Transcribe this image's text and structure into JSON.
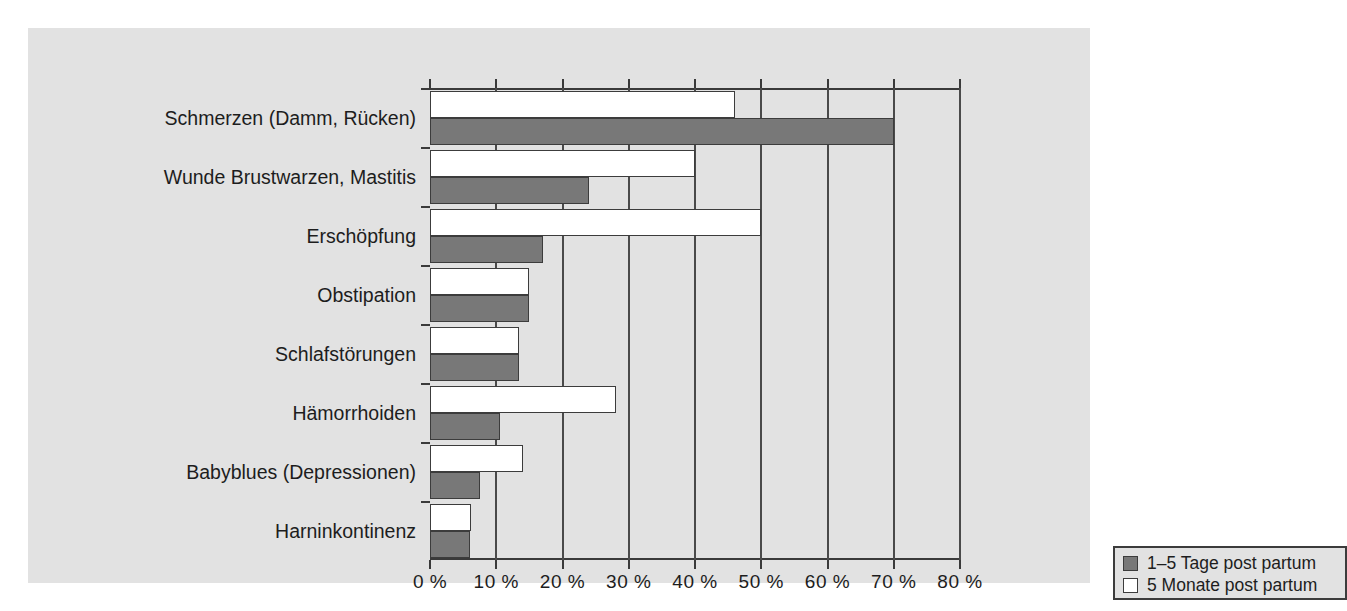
{
  "chart_data": {
    "type": "bar",
    "orientation": "horizontal",
    "title": "",
    "xlabel": "",
    "ylabel": "",
    "xlim": [
      0,
      80
    ],
    "xtick_labels": [
      "0 %",
      "10 %",
      "20 %",
      "30 %",
      "40 %",
      "50 %",
      "60 %",
      "70 %",
      "80 %"
    ],
    "xticks": [
      0,
      10,
      20,
      30,
      40,
      50,
      60,
      70,
      80
    ],
    "grid": true,
    "grid_axis": "x",
    "legend_position": "inside-bottom-right",
    "categories": [
      "Schmerzen (Damm, Rücken)",
      "Wunde Brustwarzen, Mastitis",
      "Erschöpfung",
      "Obstipation",
      "Schlafstörungen",
      "Hämorrhoiden",
      "Babyblues (Depressionen)",
      "Harninkontinenz"
    ],
    "series": [
      {
        "name": "1–5 Tage post partum",
        "color": "#787878",
        "values": [
          70,
          24,
          17,
          15,
          13.5,
          10.5,
          7.5,
          6
        ]
      },
      {
        "name": "5 Monate post partum",
        "color": "#ffffff",
        "values": [
          46,
          40,
          50,
          15,
          13.5,
          28,
          14,
          6.2
        ]
      }
    ]
  },
  "legend": {
    "entries": [
      {
        "label": "1–5 Tage post partum",
        "color": "#787878"
      },
      {
        "label": "5 Monate post partum",
        "color": "#ffffff"
      }
    ]
  },
  "colors": {
    "panel_background": "#e2e2e2",
    "page_background": "#ffffff",
    "axis": "#3a3a3a",
    "gridline": "#4a4a4a",
    "text": "#1d1d1d",
    "series_dark": "#787878",
    "series_light": "#ffffff"
  }
}
